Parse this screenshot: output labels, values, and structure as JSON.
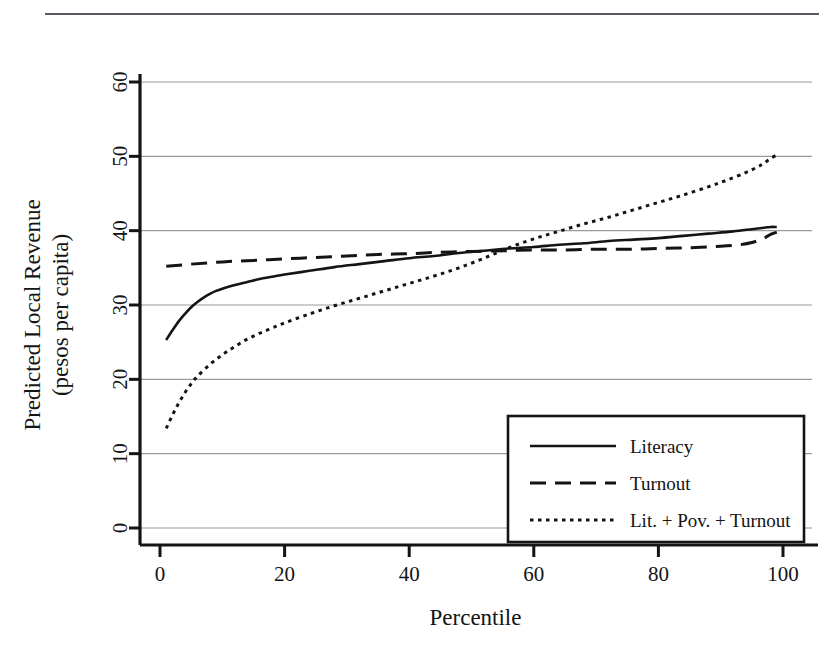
{
  "figure": {
    "has_top_rule": true,
    "background_color": "#ffffff",
    "ink_color": "#141414",
    "grid_color": "#9a9a9a"
  },
  "chart_data": {
    "type": "line",
    "title": "",
    "xlabel": "Percentile",
    "ylabel": "Predicted Local Revenue\n(pesos per capita)",
    "ylabel_line1": "Predicted Local Revenue",
    "ylabel_line2": "(pesos per capita)",
    "xlim": [
      0,
      100
    ],
    "ylim": [
      0,
      63
    ],
    "xticks": [
      0,
      20,
      40,
      60,
      80,
      100
    ],
    "yticks": [
      0,
      10,
      20,
      30,
      40,
      50,
      60
    ],
    "xtick_labels": [
      "0",
      "20",
      "40",
      "60",
      "80",
      "100"
    ],
    "ytick_labels": [
      "0",
      "10",
      "20",
      "30",
      "40",
      "50",
      "60"
    ],
    "grid": "horizontal",
    "legend_position": "lower-right",
    "series": [
      {
        "name": "Literacy",
        "style": "solid",
        "x": [
          1,
          2,
          3,
          4,
          5,
          6,
          7,
          8,
          9,
          10,
          12,
          14,
          16,
          18,
          20,
          24,
          28,
          32,
          36,
          40,
          44,
          48,
          52,
          56,
          60,
          64,
          68,
          72,
          76,
          80,
          84,
          88,
          92,
          95,
          97,
          98,
          99
        ],
        "y": [
          25.3,
          26.6,
          27.8,
          28.8,
          29.7,
          30.4,
          31.0,
          31.5,
          31.9,
          32.2,
          32.7,
          33.1,
          33.5,
          33.8,
          34.1,
          34.6,
          35.1,
          35.5,
          35.9,
          36.3,
          36.6,
          37.0,
          37.3,
          37.6,
          37.8,
          38.1,
          38.3,
          38.6,
          38.8,
          39.0,
          39.3,
          39.6,
          39.9,
          40.2,
          40.4,
          40.5,
          40.5
        ]
      },
      {
        "name": "Turnout",
        "style": "dashed",
        "x": [
          1,
          5,
          10,
          15,
          20,
          25,
          30,
          35,
          40,
          45,
          50,
          55,
          60,
          65,
          70,
          75,
          80,
          85,
          90,
          93,
          95,
          97,
          98,
          99
        ],
        "y": [
          35.2,
          35.5,
          35.8,
          36.0,
          36.2,
          36.4,
          36.6,
          36.8,
          36.9,
          37.1,
          37.2,
          37.3,
          37.4,
          37.4,
          37.5,
          37.5,
          37.6,
          37.7,
          37.9,
          38.1,
          38.4,
          39.0,
          39.5,
          39.8
        ]
      },
      {
        "name": "Lit. + Pov. + Turnout",
        "style": "dotted",
        "x": [
          1,
          2,
          3,
          4,
          5,
          6,
          8,
          10,
          12,
          14,
          16,
          18,
          20,
          24,
          28,
          32,
          36,
          40,
          44,
          48,
          52,
          56,
          60,
          64,
          68,
          72,
          76,
          80,
          84,
          88,
          91,
          94,
          96,
          97,
          98,
          99
        ],
        "y": [
          13.4,
          15.2,
          16.8,
          18.2,
          19.4,
          20.4,
          22.0,
          23.3,
          24.4,
          25.4,
          26.2,
          26.9,
          27.6,
          28.8,
          29.9,
          30.9,
          31.9,
          32.9,
          33.9,
          35.0,
          36.3,
          37.7,
          38.9,
          39.9,
          40.9,
          41.8,
          42.8,
          43.8,
          44.8,
          45.9,
          46.8,
          47.8,
          48.6,
          49.1,
          49.7,
          50.2
        ]
      }
    ]
  },
  "legend": {
    "entries": [
      {
        "label": "Literacy",
        "style": "solid"
      },
      {
        "label": "Turnout",
        "style": "dashed"
      },
      {
        "label": "Lit. + Pov. + Turnout",
        "style": "dotted"
      }
    ]
  }
}
